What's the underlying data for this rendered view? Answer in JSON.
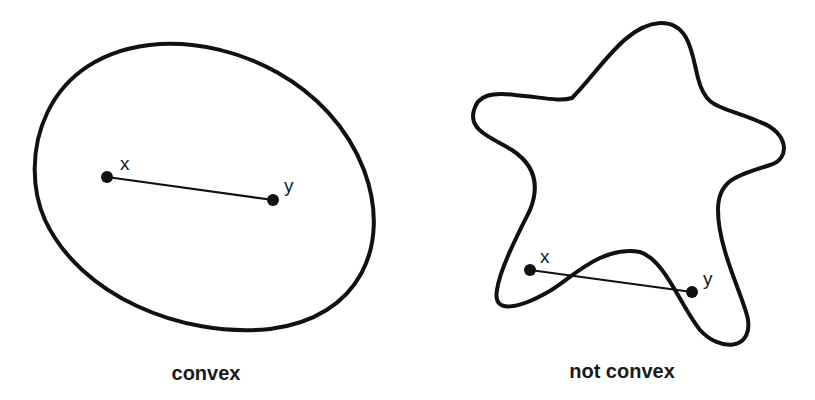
{
  "figure": {
    "type": "convexity-illustration",
    "stroke_color": "#111111",
    "background_color": "#ffffff"
  },
  "panels": [
    {
      "id": "convex",
      "shape": "ellipse",
      "caption": "convex",
      "points": [
        {
          "label": "x",
          "cx": 107,
          "cy": 177
        },
        {
          "label": "y",
          "cx": 273,
          "cy": 200
        }
      ],
      "segment_inside_shape": true
    },
    {
      "id": "not-convex",
      "shape": "star-like blob",
      "caption": "not convex",
      "points": [
        {
          "label": "x",
          "cx": 530,
          "cy": 270
        },
        {
          "label": "y",
          "cx": 692,
          "cy": 292
        }
      ],
      "segment_inside_shape": false
    }
  ]
}
